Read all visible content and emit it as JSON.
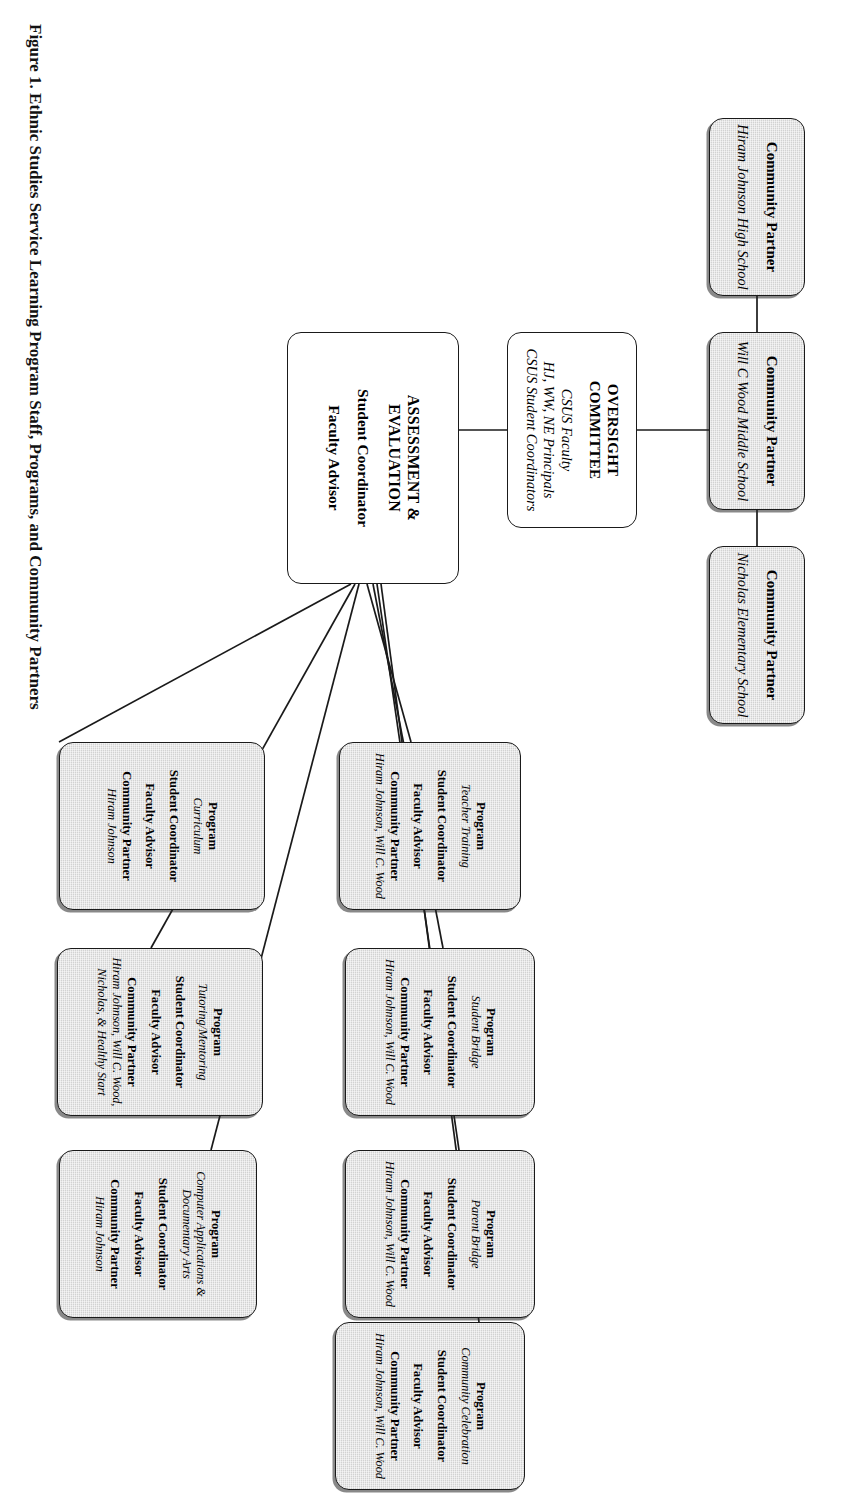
{
  "figure": {
    "caption": "Figure 1.  Ethnic Studies Service Learning Program Staff, Programs, and Community Partners"
  },
  "labels": {
    "community_partner": "Community Partner",
    "program": "Program",
    "student_coordinator": "Student Coordinator",
    "faculty_advisor": "Faculty Advisor"
  },
  "partners": [
    {
      "id": "hiram-johnson-high-school",
      "label": "Community Partner",
      "name": "Hiram Johnson High School"
    },
    {
      "id": "will-c-wood-middle-school",
      "label": "Community Partner",
      "name": "Will C Wood Middle School"
    },
    {
      "id": "nicholas-elementary-school",
      "label": "Community Partner",
      "name": "Nicholas Elementary School"
    }
  ],
  "oversight": {
    "title_line1": "OVERSIGHT",
    "title_line2": "COMMITTEE",
    "members": [
      "CSUS Faculty",
      "HJ, WW, NE Principals",
      "CSUS Student Coordinators"
    ]
  },
  "assessment": {
    "title": "ASSESSMENT & EVALUATION",
    "roles": [
      "Student Coordinator",
      "Faculty Advisor"
    ]
  },
  "programs": [
    {
      "id": "curriculum",
      "program_label": "Program",
      "program_name": "Curriculum",
      "student_coordinator_label": "Student Coordinator",
      "faculty_advisor_label": "Faculty Advisor",
      "community_partner_label": "Community Partner",
      "community_partner_value": "Hiram Johnson"
    },
    {
      "id": "tutoring-mentoring",
      "program_label": "Program",
      "program_name": "Tutoring/Mentoring",
      "student_coordinator_label": "Student Coordinator",
      "faculty_advisor_label": "Faculty Advisor",
      "community_partner_label": "Community Partner",
      "community_partner_value": "Hiram Johnson, Will C. Wood, Nicholas, & Healthy Start"
    },
    {
      "id": "computer-applications-documentary-arts",
      "program_label": "Program",
      "program_name": "Computer Applications & Documentary Arts",
      "student_coordinator_label": "Student Coordinator",
      "faculty_advisor_label": "Faculty Advisor",
      "community_partner_label": "Community Partner",
      "community_partner_value": "Hiram Johnson"
    },
    {
      "id": "teacher-training",
      "program_label": "Program",
      "program_name": "Teacher Training",
      "student_coordinator_label": "Student Coordinator",
      "faculty_advisor_label": "Faculty Advisor",
      "community_partner_label": "Community Partner",
      "community_partner_value": "Hiram Johnson, Will C. Wood"
    },
    {
      "id": "student-bridge",
      "program_label": "Program",
      "program_name": "Student Bridge",
      "student_coordinator_label": "Student Coordinator",
      "faculty_advisor_label": "Faculty Advisor",
      "community_partner_label": "Community Partner",
      "community_partner_value": "Hiram Johnson, Will C. Wood"
    },
    {
      "id": "parent-bridge",
      "program_label": "Program",
      "program_name": "Parent Bridge",
      "student_coordinator_label": "Student Coordinator",
      "faculty_advisor_label": "Faculty Advisor",
      "community_partner_label": "Community Partner",
      "community_partner_value": "Hiram Johnson, Will C. Wood"
    },
    {
      "id": "community-celebration",
      "program_label": "Program",
      "program_name": "Community Celebration",
      "student_coordinator_label": "Student Coordinator",
      "faculty_advisor_label": "Faculty Advisor",
      "community_partner_label": "Community Partner",
      "community_partner_value": "Hiram Johnson, Will C. Wood"
    }
  ],
  "colors": {
    "node_fill_shaded": "#d2d2d2",
    "node_fill_plain": "#ffffff",
    "node_border": "#1a1a1a",
    "text": "#121212",
    "connector": "#1a1a1a"
  }
}
